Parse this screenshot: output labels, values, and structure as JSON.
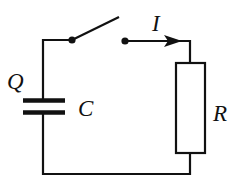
{
  "diagram": {
    "type": "RC circuit with open switch",
    "labels": {
      "charge": "Q",
      "capacitance": "C",
      "current": "I",
      "resistance": "R"
    },
    "components": [
      {
        "kind": "capacitor",
        "label": "C",
        "charge_label": "Q"
      },
      {
        "kind": "switch",
        "state": "open"
      },
      {
        "kind": "resistor",
        "label": "R"
      },
      {
        "kind": "current-arrow",
        "label": "I",
        "direction": "right"
      }
    ],
    "colors": {
      "line": "#111111",
      "background": "#ffffff"
    }
  }
}
